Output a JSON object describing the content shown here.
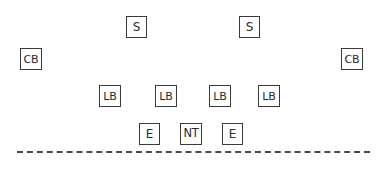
{
  "diagram": {
    "type": "football-defensive-alignment",
    "background_color": "#ffffff",
    "box_border_color": "#3a3a3a",
    "text_color": "#2b2b2b",
    "line_color": "#4a4a4a",
    "line_of_scrimmage": {
      "style": "dashed",
      "x_start": 17,
      "x_end": 370,
      "y": 152
    },
    "rows": [
      {
        "name": "safeties",
        "y": 16,
        "players": [
          {
            "label": "S",
            "x": 126,
            "y": 16,
            "size": "sz-single",
            "position_name": "safety-left"
          },
          {
            "label": "S",
            "x": 239,
            "y": 16,
            "size": "sz-single",
            "position_name": "safety-right"
          }
        ]
      },
      {
        "name": "cornerbacks",
        "y": 48,
        "players": [
          {
            "label": "CB",
            "x": 20,
            "y": 48,
            "size": "sz-wide",
            "position_name": "cornerback-left"
          },
          {
            "label": "CB",
            "x": 341,
            "y": 48,
            "size": "sz-wide",
            "position_name": "cornerback-right"
          }
        ]
      },
      {
        "name": "linebackers",
        "y": 85,
        "players": [
          {
            "label": "LB",
            "x": 99,
            "y": 85,
            "size": "sz-wide",
            "position_name": "linebacker-1"
          },
          {
            "label": "LB",
            "x": 155,
            "y": 85,
            "size": "sz-wide",
            "position_name": "linebacker-2"
          },
          {
            "label": "LB",
            "x": 209,
            "y": 85,
            "size": "sz-wide",
            "position_name": "linebacker-3"
          },
          {
            "label": "LB",
            "x": 258,
            "y": 85,
            "size": "sz-wide",
            "position_name": "linebacker-4"
          }
        ]
      },
      {
        "name": "defensive-line",
        "y": 123,
        "players": [
          {
            "label": "E",
            "x": 139,
            "y": 123,
            "size": "sz-single",
            "position_name": "defensive-end-left"
          },
          {
            "label": "NT",
            "x": 180,
            "y": 123,
            "size": "sz-tight",
            "position_name": "nose-tackle"
          },
          {
            "label": "E",
            "x": 222,
            "y": 123,
            "size": "sz-single",
            "position_name": "defensive-end-right"
          }
        ]
      }
    ]
  }
}
